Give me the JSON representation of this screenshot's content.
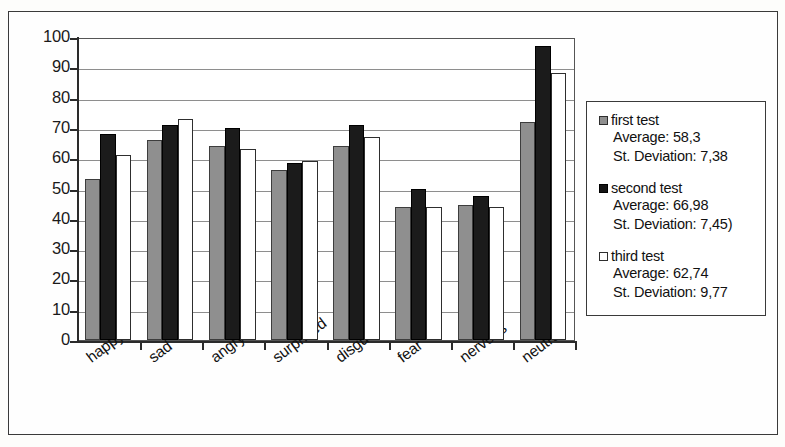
{
  "chart_data": {
    "type": "bar",
    "title": "",
    "xlabel": "",
    "ylabel": "",
    "ylim": [
      0,
      100
    ],
    "ytick_step": 10,
    "yticks": [
      100,
      90,
      80,
      70,
      60,
      50,
      40,
      30,
      20,
      10,
      0
    ],
    "grid": true,
    "legend_position": "right",
    "categories": [
      "happy",
      "sad",
      "angry",
      "surprised",
      "disgust",
      "fear",
      "nervous",
      "neutral"
    ],
    "series": [
      {
        "name": "first test",
        "color": "#8f8f8f",
        "average": "58,3",
        "st_deviation": "7,38",
        "values": [
          53,
          66,
          64,
          56,
          64,
          44,
          44.5,
          72
        ]
      },
      {
        "name": "second test",
        "color": "#1b1b1b",
        "average": "66,98",
        "st_deviation": "7,45)",
        "values": [
          68,
          71,
          70,
          58.5,
          71,
          50,
          47.5,
          97
        ]
      },
      {
        "name": "third test",
        "color": "#ffffff",
        "average": "62,74",
        "st_deviation": "9,77",
        "values": [
          61,
          73,
          63,
          59,
          67,
          44,
          44,
          88
        ]
      }
    ]
  },
  "legend": {
    "entries": [
      {
        "label": "first test",
        "average_line": "Average: 58,3",
        "deviation_line": "St. Deviation: 7,38"
      },
      {
        "label": "second test",
        "average_line": "Average: 66,98",
        "deviation_line": "St. Deviation: 7,45)"
      },
      {
        "label": "third test",
        "average_line": "Average: 62,74",
        "deviation_line": "St. Deviation: 9,77"
      }
    ]
  }
}
